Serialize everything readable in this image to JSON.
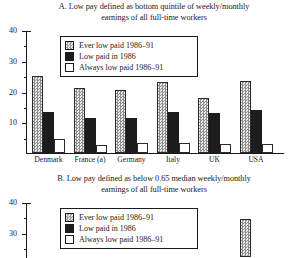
{
  "figure": {
    "font_note": "serif",
    "panels": [
      "A",
      "B"
    ]
  },
  "legend": {
    "items": [
      {
        "label": "Ever low paid 1986–91",
        "swatch": "hatched-grey"
      },
      {
        "label": "Low paid in 1986",
        "swatch": "solid-black"
      },
      {
        "label": "Always low paid 1986–91",
        "swatch": "white"
      }
    ]
  },
  "panelA": {
    "title_line1": "A. Low pay defined as bottom quintile of weekly/monthly",
    "title_line2": "earnings of all full-time workers",
    "ytick_labels": [
      "40",
      "30",
      "20",
      "10"
    ]
  },
  "panelB": {
    "title_line1": "B. Low pay defined as below 0.65 median weekly/monthly",
    "title_line2": "earnings of all full-time workers",
    "ytick_labels": [
      "40",
      "30"
    ]
  },
  "chart_data": [
    {
      "type": "bar",
      "panel": "A",
      "title": "A. Low pay defined as bottom quintile of weekly/monthly earnings of all full-time workers",
      "xlabel": "",
      "ylabel": "",
      "ylim": [
        0,
        40
      ],
      "yticks": [
        0,
        10,
        20,
        30,
        40
      ],
      "grid": false,
      "legend_position": "top-left inside",
      "categories": [
        "Denmark",
        "France (a)",
        "Germany",
        "Italy",
        "UK",
        "USA"
      ],
      "series": [
        {
          "name": "Ever low paid 1986–91",
          "values": [
            25,
            21,
            20.5,
            23,
            18,
            23.5
          ]
        },
        {
          "name": "Low paid in 1986",
          "values": [
            13.5,
            11.5,
            11.5,
            13.5,
            13,
            14
          ]
        },
        {
          "name": "Always low paid 1986–91",
          "values": [
            4.5,
            2.5,
            3.3,
            3.3,
            3,
            3
          ]
        }
      ]
    },
    {
      "type": "bar",
      "panel": "B",
      "title": "B. Low pay defined as below 0.65 median weekly/monthly earnings of all full-time workers",
      "note": "Panel B is cropped by the bottom edge of the screenshot; only the upper portion of the plot is visible.",
      "xlabel": "",
      "ylabel": "",
      "ylim": [
        0,
        40
      ],
      "yticks": [
        30,
        40
      ],
      "grid": false,
      "legend_position": "top-left inside",
      "categories": [
        "Denmark",
        "France (a)",
        "Germany",
        "Italy",
        "UK",
        "USA"
      ],
      "series": [
        {
          "name": "Ever low paid 1986–91",
          "values": [
            null,
            null,
            null,
            null,
            null,
            28
          ]
        },
        {
          "name": "Low paid in 1986",
          "values": [
            null,
            null,
            null,
            null,
            null,
            null
          ]
        },
        {
          "name": "Always low paid 1986–91",
          "values": [
            null,
            null,
            null,
            null,
            null,
            null
          ]
        }
      ]
    }
  ]
}
